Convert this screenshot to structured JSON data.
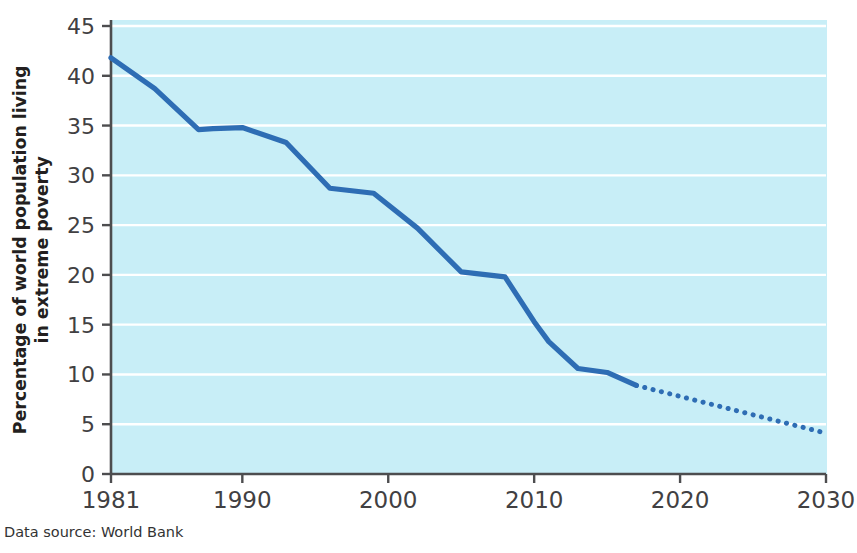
{
  "caption": "Data source: World Bank",
  "colors": {
    "line": "#2e6db4",
    "plot_background": "#c8eef7",
    "gridline": "#ffffff",
    "axis": "#4d4d4f",
    "text": "#414042"
  },
  "chart_data": {
    "type": "line",
    "title": "",
    "xlabel": "",
    "ylabel": "Percentage of world population living in extreme poverty",
    "ylabel_lines": [
      "Percentage of world population living",
      "in extreme poverty"
    ],
    "xlim": [
      1981,
      2030
    ],
    "ylim": [
      0,
      45
    ],
    "xticks": [
      1981,
      1990,
      2000,
      2010,
      2020,
      2030
    ],
    "xtick_labels": [
      "1981",
      "1990",
      "2000",
      "2010",
      "2020",
      "2030"
    ],
    "yticks": [
      0,
      5,
      10,
      15,
      20,
      25,
      30,
      35,
      40,
      45
    ],
    "ytick_labels": [
      "0",
      "5",
      "10",
      "15",
      "20",
      "25",
      "30",
      "35",
      "40",
      "45"
    ],
    "grid": "horizontal",
    "legend": "none",
    "series": [
      {
        "name": "Observed extreme poverty rate",
        "style": "solid",
        "x": [
          1981,
          1984,
          1987,
          1988,
          1990,
          1993,
          1996,
          1999,
          2002,
          2005,
          2008,
          2010,
          2011,
          2013,
          2015,
          2017
        ],
        "values": [
          41.8,
          38.7,
          34.6,
          34.7,
          34.8,
          33.3,
          28.7,
          28.2,
          24.7,
          20.3,
          19.8,
          15.3,
          13.3,
          10.6,
          10.2,
          8.9
        ]
      },
      {
        "name": "Projected extreme poverty rate",
        "style": "dotted",
        "x": [
          2017,
          2030
        ],
        "values": [
          8.9,
          4.1
        ]
      }
    ]
  }
}
